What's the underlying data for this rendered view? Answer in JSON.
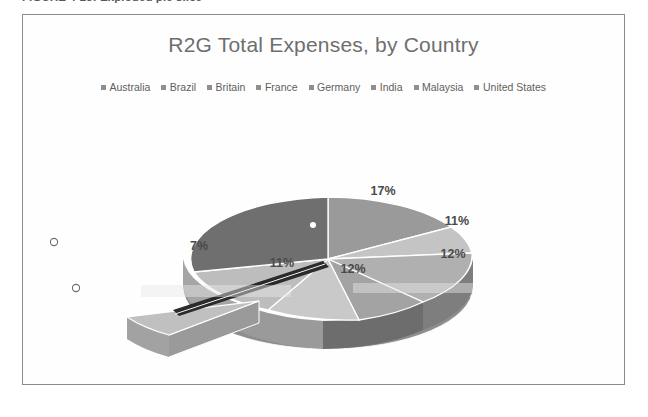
{
  "figure": {
    "caption": "FIGURE 4-23: Exploded pie slice"
  },
  "chart_data": {
    "type": "pie",
    "title": "R2G Total Expenses, by Country",
    "legend_position": "top",
    "grid": false,
    "exploded_slice": "Australia",
    "selected": true,
    "categories": [
      "Australia",
      "Brazil",
      "Britain",
      "France",
      "Germany",
      "India",
      "Malaysia",
      "United States"
    ],
    "values": [
      7,
      11,
      12,
      12,
      11,
      17,
      15,
      15
    ],
    "labels": [
      "7%",
      "11%",
      "12%",
      "12%",
      "11%",
      "17%",
      "",
      ""
    ],
    "slice_colors": [
      "#b9b9b9",
      "#c9c9c9",
      "#a3a3a3",
      "#b0b0b0",
      "#c4c4c4",
      "#9a9a9a",
      "#6f6f6f",
      "#8c8c8c"
    ],
    "side_colors": [
      "#9e9e9e",
      "#adadad",
      "#8b8b8b",
      "#959595",
      "#a8a8a8",
      "#848484",
      "#5c5c5c",
      "#767676"
    ],
    "visible_labels": [
      {
        "text": "17%",
        "x": 360,
        "y": 84
      },
      {
        "text": "11%",
        "x": 434,
        "y": 114
      },
      {
        "text": "12%",
        "x": 430,
        "y": 147
      },
      {
        "text": "12%",
        "x": 330,
        "y": 162
      },
      {
        "text": "11%",
        "x": 259,
        "y": 156
      },
      {
        "text": "7%",
        "x": 176,
        "y": 139
      }
    ]
  },
  "legend": {
    "swatch_color": "#8f8f8f",
    "items": [
      {
        "label": "Australia"
      },
      {
        "label": "Brazil"
      },
      {
        "label": "Britain"
      },
      {
        "label": "France"
      },
      {
        "label": "Germany"
      },
      {
        "label": "India"
      },
      {
        "label": "Malaysia"
      },
      {
        "label": "United States"
      }
    ]
  },
  "selection": {
    "handle_count": 3
  },
  "colors": {
    "frame_border": "#8a8a8a",
    "title_text": "#6e6e6e",
    "legend_text": "#5e5e5e",
    "label_text": "#4a4a4a",
    "background": "#ffffff"
  }
}
